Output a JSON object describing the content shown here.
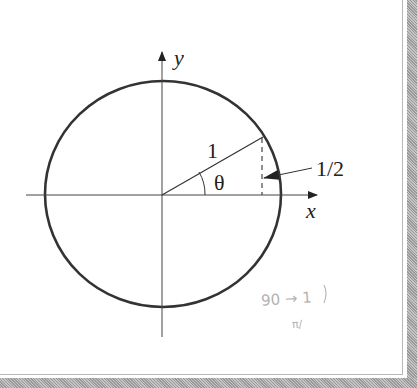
{
  "diagram": {
    "type": "unit-circle",
    "center": {
      "x": 162,
      "y": 195
    },
    "radius": 116,
    "axes": {
      "x_label": "x",
      "y_label": "y"
    },
    "labels": {
      "radius": "1",
      "angle": "θ",
      "height": "1/2"
    },
    "handwritten_note": {
      "line1": "90 → 1",
      "line2": "π/"
    }
  },
  "colors": {
    "ink": "#222222",
    "frame": "#a8a8a8",
    "pencil": "#9a9a9a"
  }
}
